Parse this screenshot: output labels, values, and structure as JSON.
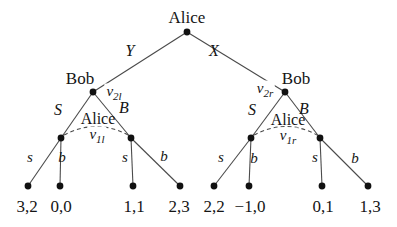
{
  "figure": {
    "root": {
      "player": "Alice"
    },
    "root_actions": {
      "left": "Y",
      "right": "X"
    },
    "bob": {
      "left": {
        "player": "Bob",
        "id": {
          "base": "v",
          "sub": "2l"
        },
        "actions": {
          "left": "S",
          "right": "B"
        }
      },
      "right": {
        "player": "Bob",
        "id": {
          "base": "v",
          "sub": "2r"
        },
        "actions": {
          "left": "S",
          "right": "B"
        }
      }
    },
    "info_sets": {
      "left": {
        "player": "Alice",
        "id": {
          "base": "v",
          "sub": "1l"
        }
      },
      "right": {
        "player": "Alice",
        "id": {
          "base": "v",
          "sub": "1r"
        }
      }
    },
    "leaf_actions": {
      "sell": "s",
      "buy": "b"
    },
    "payoffs": [
      "3,2",
      "0,0",
      "1,1",
      "2,3",
      "2,2",
      "−1,0",
      "0,1",
      "1,3"
    ],
    "colors": {
      "line": "#4a4a4a",
      "node": "#111111",
      "text": "#151515",
      "background": "#ffffff"
    }
  }
}
